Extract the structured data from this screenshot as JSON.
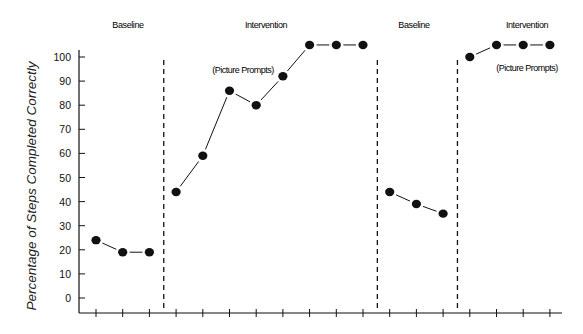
{
  "chart_data": {
    "type": "line",
    "title": "",
    "xlabel": "",
    "ylabel": "Percentage of Steps Completed Correctly",
    "ylim": [
      0,
      100
    ],
    "yticks": [
      0,
      10,
      20,
      30,
      40,
      50,
      60,
      70,
      80,
      90,
      100
    ],
    "x": [
      1,
      2,
      3,
      4,
      5,
      6,
      7,
      8,
      9,
      10,
      11,
      12,
      13,
      14,
      15,
      16,
      17,
      18
    ],
    "x_tick_labels_shown": false,
    "grid": false,
    "legend": null,
    "phases": [
      {
        "label": "Baseline",
        "sessions": [
          1,
          2,
          3
        ],
        "values": [
          24,
          19,
          19
        ]
      },
      {
        "label": "Intervention",
        "annotation": "(Picture Prompts)",
        "sessions": [
          4,
          5,
          6,
          7,
          8,
          9,
          10,
          11
        ],
        "values": [
          44,
          59,
          86,
          80,
          92,
          105,
          105,
          105
        ]
      },
      {
        "label": "Baseline",
        "sessions": [
          12,
          13,
          14
        ],
        "values": [
          44,
          39,
          35
        ]
      },
      {
        "label": "Intervention",
        "annotation": "(Picture Prompts)",
        "sessions": [
          15,
          16,
          17,
          18
        ],
        "values": [
          100,
          105,
          105,
          105
        ]
      }
    ],
    "phase_change_lines_after_session": [
      3,
      11,
      14
    ],
    "phase_change_line_style": "dashed"
  },
  "labels": {
    "y_title": "Percentage of Steps Completed Correctly",
    "phase_1": "Baseline",
    "phase_2": "Intervention",
    "phase_2_note": "(Picture Prompts)",
    "phase_3": "Baseline",
    "phase_4": "Intervention",
    "phase_4_note": "(Picture Prompts)"
  },
  "colors": {
    "ink": "#111111",
    "background": "#ffffff"
  }
}
